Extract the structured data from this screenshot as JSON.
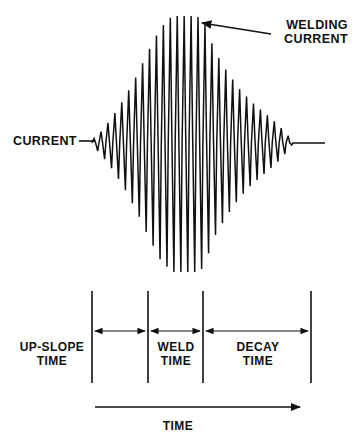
{
  "figure": {
    "background_color": "#ffffff",
    "ink_color": "#111111"
  },
  "annotations": {
    "welding_current": "WELDING\nCURRENT",
    "current": "CURRENT",
    "up_slope_time": "UP-SLOPE\nTIME",
    "weld_time": "WELD\nTIME",
    "decay_time": "DECAY\nTIME",
    "time_axis": "TIME"
  },
  "chart_data": {
    "type": "line",
    "title": "",
    "xlabel": "TIME",
    "ylabel": "CURRENT",
    "grid": false,
    "legend": "none",
    "axis_ranges": {
      "x_px": [
        92,
        325
      ],
      "y_px": [
        16,
        272
      ],
      "baseline_y_px": 143
    },
    "envelope": {
      "x": [
        92,
        100,
        112,
        125,
        138,
        148,
        160,
        172,
        184,
        196,
        203,
        215,
        228,
        240,
        252,
        264,
        276,
        288,
        293,
        325
      ],
      "amplitude_fraction": [
        0.02,
        0.08,
        0.2,
        0.36,
        0.55,
        0.72,
        0.9,
        1.0,
        1.0,
        1.0,
        0.97,
        0.72,
        0.55,
        0.42,
        0.32,
        0.24,
        0.16,
        0.06,
        0.0,
        0.0
      ]
    },
    "oscillation": {
      "cycles": 29,
      "shape": "sawtooth-like alternating peaks",
      "peak_max_y_px": 16,
      "trough_min_y_px": 272
    },
    "phase_markers": {
      "tick_x_px": [
        92,
        148,
        203,
        311
      ],
      "phases": [
        {
          "name": "UP-SLOPE TIME",
          "start_x_px": 92,
          "end_x_px": 148
        },
        {
          "name": "WELD TIME",
          "start_x_px": 148,
          "end_x_px": 203
        },
        {
          "name": "DECAY TIME",
          "start_x_px": 203,
          "end_x_px": 311
        }
      ],
      "tick_top_y_px": 291,
      "tick_bottom_y_px": 383,
      "dimension_arrow_y_px": 331
    },
    "time_arrow": {
      "start_x_px": 95,
      "end_x_px": 300,
      "y_px": 407
    },
    "leaders": [
      {
        "label": "WELDING CURRENT",
        "arrow_tip_px": [
          200,
          23
        ],
        "arrow_tail_px": [
          271,
          34
        ]
      },
      {
        "label": "CURRENT",
        "line_start_px": [
          79,
          141
        ],
        "line_end_px": [
          95,
          141
        ]
      }
    ]
  }
}
